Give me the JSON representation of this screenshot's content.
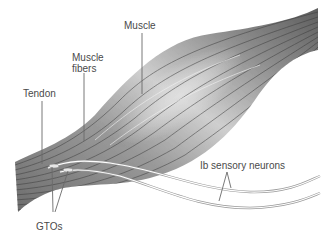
{
  "diagram": {
    "labels": {
      "muscle": "Muscle",
      "muscle_fibers_line1": "Muscle",
      "muscle_fibers_line2": "fibers",
      "tendon": "Tendon",
      "gtos": "GTOs",
      "ib_neurons": "Ib sensory neurons"
    },
    "colors": {
      "muscle_dark": "#5a5a5a",
      "muscle_mid": "#8c8c8c",
      "muscle_light": "#d2d2d2",
      "fiber_line": "#3c3c3c",
      "neuron_line": "#9a9a9a",
      "neuron_fill": "#ffffff",
      "leader_line": "#6a6a6a",
      "text": "#4a4a4a"
    }
  }
}
